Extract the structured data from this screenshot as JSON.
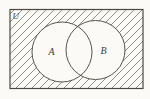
{
  "figure": {
    "type": "venn-diagram",
    "universe_label": "U",
    "sets": [
      {
        "label": "A"
      },
      {
        "label": "B"
      }
    ],
    "shading": {
      "style": "diagonal-hatch",
      "direction": "bottom-left-to-top-right",
      "region": "inside universe rectangle, outside both circles"
    },
    "colors": {
      "paper": "#fbfaf7",
      "outline": "#4a4a42",
      "hatch_line": "#74746a",
      "set_fill": "#fbfaf7",
      "label_text": "#3d3d36"
    }
  }
}
